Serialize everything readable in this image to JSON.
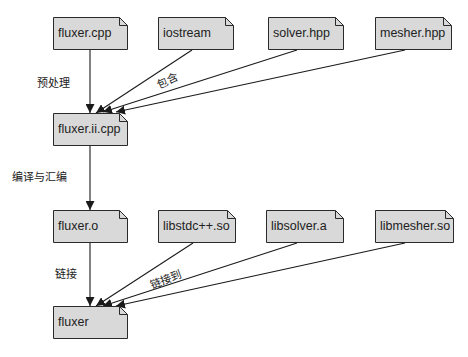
{
  "colors": {
    "fill": "#d9d9d9",
    "stroke": "#2a2a2a",
    "text": "#222222"
  },
  "nodes": {
    "fluxer_cpp": {
      "label": "fluxer.cpp",
      "x": 53,
      "y": 17,
      "w": 75
    },
    "iostream": {
      "label": "iostream",
      "x": 158,
      "y": 17,
      "w": 76
    },
    "solver_hpp": {
      "label": "solver.hpp",
      "x": 268,
      "y": 17,
      "w": 76
    },
    "mesher_hpp": {
      "label": "mesher.hpp",
      "x": 375,
      "y": 17,
      "w": 77
    },
    "fluxer_ii_cpp": {
      "label": "fluxer.ii.cpp",
      "x": 53,
      "y": 113,
      "w": 75
    },
    "fluxer_o": {
      "label": "fluxer.o",
      "x": 53,
      "y": 210,
      "w": 75
    },
    "libstdcpp_so": {
      "label": "libstdc++.so",
      "x": 158,
      "y": 210,
      "w": 78
    },
    "libsolver_a": {
      "label": "libsolver.a",
      "x": 266,
      "y": 210,
      "w": 78
    },
    "libmesher_so": {
      "label": "libmesher.so",
      "x": 375,
      "y": 210,
      "w": 79
    },
    "fluxer": {
      "label": "fluxer",
      "x": 53,
      "y": 306,
      "w": 75
    }
  },
  "edge_labels": {
    "preprocess": "预处理",
    "include": "包含",
    "compile_assemble": "编译与汇编",
    "link": "链接",
    "link_to": "链接到"
  }
}
